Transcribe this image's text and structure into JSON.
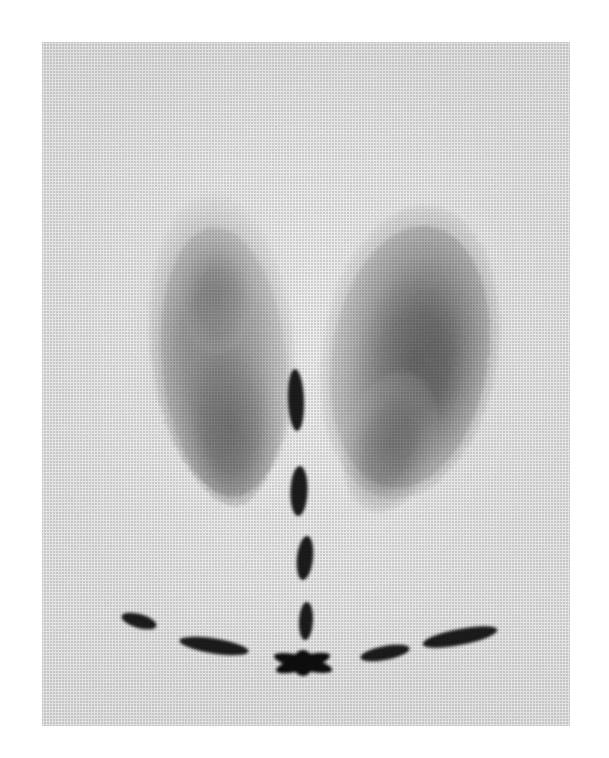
{
  "image": {
    "modality": "thyroid-scintigram",
    "title": "Thyroid scintigram",
    "width": 609,
    "height": 758,
    "page_background": "#ffffff",
    "field": {
      "x": 42,
      "y": 42,
      "width": 528,
      "height": 684,
      "background_color": "#ebebeb",
      "texture": "halftone-dot-screen"
    },
    "tone": {
      "film_base": "#ebebeb",
      "mid_uptake": "#9a9a9a",
      "high_uptake": "#3b3b3b",
      "marker_color": "#1a1a1a"
    }
  },
  "uptake_regions": [
    {
      "name": "left-thyroid-lobe",
      "label": "Left lobe",
      "side": "left",
      "centroid": {
        "x": 222,
        "y": 345
      },
      "extent": {
        "top": 198,
        "bottom": 512,
        "left": 148,
        "right": 290
      },
      "intensity": "high",
      "description": "Elongated vertically oriented lobe with heterogeneous uptake, densest in mid to lower third"
    },
    {
      "name": "right-thyroid-lobe",
      "label": "Right lobe",
      "side": "right",
      "centroid": {
        "x": 408,
        "y": 352
      },
      "extent": {
        "top": 210,
        "bottom": 520,
        "left": 330,
        "right": 500
      },
      "intensity": "very-high",
      "description": "Larger, rounder and denser than the contralateral lobe, uptake peaks centrally"
    },
    {
      "name": "isthmus-cold-zone",
      "label": "Isthmus region",
      "side": "center",
      "centroid": {
        "x": 300,
        "y": 330
      },
      "intensity": "low",
      "description": "Relative photopenic gap separating the two lobes"
    }
  ],
  "markers": {
    "description": "Radioactive surface markers outlining the midline and the suprasternal notch / clavicles",
    "midline": {
      "name": "midline-marker-chain",
      "label": "Midline marker",
      "dashes": [
        {
          "id": "midline-dash-1",
          "cx": 296,
          "cy": 400,
          "rx": 8,
          "ry": 31,
          "rot": -2
        },
        {
          "id": "midline-dash-2",
          "cx": 299,
          "cy": 491,
          "rx": 8.5,
          "ry": 25,
          "rot": 2
        },
        {
          "id": "midline-dash-3",
          "cx": 305,
          "cy": 558,
          "rx": 8,
          "ry": 22,
          "rot": 6
        },
        {
          "id": "midline-dash-4",
          "cx": 306,
          "cy": 621,
          "rx": 7,
          "ry": 19,
          "rot": 3
        }
      ]
    },
    "clavicular": {
      "name": "clavicle-marker-chain",
      "label": "Clavicular / suprasternal marker",
      "dashes": [
        {
          "id": "clavicle-dash-left-outer",
          "cx": 139,
          "cy": 621,
          "rx": 18,
          "ry": 7,
          "rot": 16
        },
        {
          "id": "clavicle-dash-left-inner",
          "cx": 214,
          "cy": 646,
          "rx": 35,
          "ry": 7.5,
          "rot": 9
        },
        {
          "id": "clavicle-dash-right-inner",
          "cx": 385,
          "cy": 653,
          "rx": 25,
          "ry": 7,
          "rot": -11
        },
        {
          "id": "clavicle-dash-right-outer",
          "cx": 460,
          "cy": 637,
          "rx": 38,
          "ry": 8,
          "rot": -11
        }
      ]
    },
    "junction": {
      "name": "midline-clavicle-junction-marker",
      "label": "Sternal notch junction marker",
      "cx": 303,
      "cy": 663,
      "wings": [
        {
          "id": "junction-wing-left",
          "rx": 30,
          "ry": 7,
          "rot": 14
        },
        {
          "id": "junction-wing-right",
          "rx": 28,
          "ry": 7,
          "rot": -16
        },
        {
          "id": "junction-core",
          "rx": 10,
          "ry": 13,
          "rot": 0
        }
      ]
    }
  },
  "chart_data": {
    "type": "heatmap",
    "xlabel": "",
    "ylabel": "",
    "grid": false,
    "legend": "none",
    "series": [
      {
        "name": "Left lobe uptake",
        "values": [
          0.78
        ]
      },
      {
        "name": "Right lobe uptake",
        "values": [
          0.95
        ]
      },
      {
        "name": "Isthmus uptake",
        "values": [
          0.12
        ]
      },
      {
        "name": "Background",
        "values": [
          0.05
        ]
      }
    ]
  }
}
